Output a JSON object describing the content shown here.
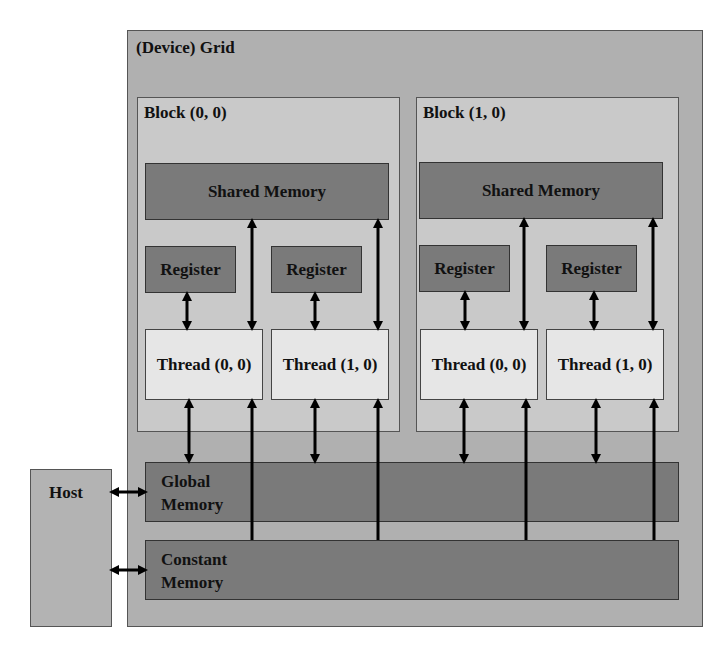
{
  "diagram": {
    "title_fragment": "",
    "grid": {
      "label": "(Device) Grid"
    },
    "blocks": [
      {
        "label": "Block (0, 0)",
        "shared_memory": "Shared Memory",
        "registers": [
          "Register",
          "Register"
        ],
        "threads": [
          "Thread (0, 0)",
          "Thread (1, 0)"
        ]
      },
      {
        "label": "Block (1, 0)",
        "shared_memory": "Shared Memory",
        "registers": [
          "Register",
          "Register"
        ],
        "threads": [
          "Thread (0, 0)",
          "Thread (1, 0)"
        ]
      }
    ],
    "global_memory": {
      "line1": "Global",
      "line2": "Memory"
    },
    "constant_memory": {
      "line1": "Constant",
      "line2": "Memory"
    },
    "host": {
      "label": "Host"
    },
    "colors": {
      "grid_bg": "#b0b0b0",
      "block_bg": "#c9c9c9",
      "memory_bg": "#7a7a7a",
      "thread_bg": "#e6e6e6",
      "arrow": "#000000"
    }
  }
}
